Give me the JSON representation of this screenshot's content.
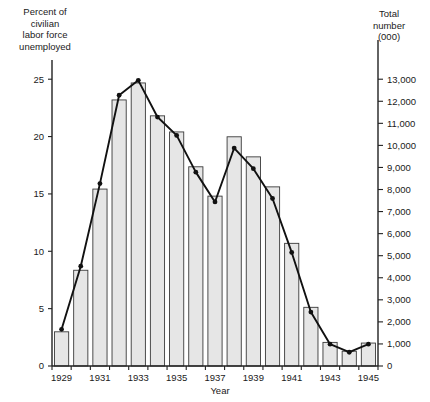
{
  "left_axis": {
    "title": "Percent of\ncivilian\nlabor force\nunemployed",
    "ticks": [
      "0",
      "5",
      "10",
      "15",
      "20",
      "25"
    ]
  },
  "right_axis": {
    "title": "Total\nnumber\n(000)",
    "ticks": [
      "0",
      "1,000",
      "2,000",
      "3,000",
      "4,000",
      "5,000",
      "6,000",
      "7,000",
      "8,000",
      "9,000",
      "10,000",
      "11,000",
      "12,000",
      "13,000"
    ]
  },
  "x_axis": {
    "title": "Year",
    "labels": [
      "1929",
      "1931",
      "1933",
      "1935",
      "1937",
      "1939",
      "1941",
      "1943",
      "1945"
    ]
  },
  "chart_data": {
    "type": "bar",
    "title": "",
    "xlabel": "Year",
    "ylabel": "Percent of civilian labor force unemployed",
    "y2label": "Total number (000)",
    "grid": false,
    "legend": "none",
    "categories": [
      "1929",
      "1930",
      "1931",
      "1932",
      "1933",
      "1934",
      "1935",
      "1936",
      "1937",
      "1938",
      "1939",
      "1940",
      "1941",
      "1942",
      "1943",
      "1944",
      "1945"
    ],
    "ylim": [
      0,
      26.5
    ],
    "y2lim": [
      0,
      13780
    ],
    "yticks": [
      0,
      5,
      10,
      15,
      20,
      25
    ],
    "y2ticks": [
      0,
      1000,
      2000,
      3000,
      4000,
      5000,
      6000,
      7000,
      8000,
      9000,
      10000,
      11000,
      12000,
      13000
    ],
    "series": [
      {
        "name": "Total number unemployed (000)",
        "render": "bar",
        "axis": "right",
        "units": "thousands",
        "values": [
          1550,
          4340,
          8020,
          12060,
          12830,
          11340,
          10610,
          9030,
          7700,
          10390,
          9480,
          8120,
          5560,
          2660,
          1070,
          670,
          1040
        ]
      },
      {
        "name": "Percent of civilian labor force unemployed",
        "render": "line",
        "axis": "left",
        "units": "percent",
        "values": [
          3.2,
          8.7,
          15.9,
          23.6,
          24.9,
          21.7,
          20.1,
          16.9,
          14.3,
          19.0,
          17.2,
          14.6,
          9.9,
          4.7,
          1.9,
          1.2,
          1.9
        ]
      }
    ]
  },
  "geometry": {
    "plot_left": 52,
    "plot_right": 378,
    "plot_top": 62,
    "plot_bottom": 366,
    "bar_gap_ratio": 0.26
  }
}
